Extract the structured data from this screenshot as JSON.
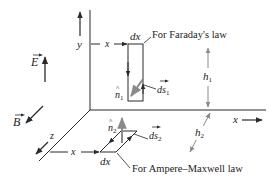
{
  "colors": {
    "line": "#2a2a2a",
    "grey_arrow": "#8a8a8a",
    "background": "#ffffff"
  },
  "axes": {
    "y_label": "y",
    "x_label_right": "x",
    "z_label": "z",
    "x_label_top": "x",
    "x_label_bottom": "x"
  },
  "fields": {
    "E_label": "E",
    "B_label": "B"
  },
  "faraday_loop": {
    "width_label": "dx",
    "caption": "For Faraday's law",
    "normal_label": "n",
    "normal_sub": "1",
    "ds_label": "ds",
    "ds_sub": "1",
    "height_label": "h",
    "height_sub": "1"
  },
  "ampere_loop": {
    "width_label": "dx",
    "caption": "For Ampere–Maxwell law",
    "normal_label": "n",
    "normal_sub": "2",
    "ds_label": "ds",
    "ds_sub": "2",
    "height_label": "h",
    "height_sub": "2"
  }
}
